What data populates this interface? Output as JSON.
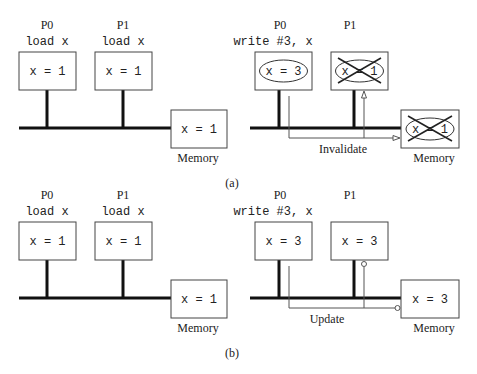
{
  "panels": {
    "a": {
      "label": "(a)",
      "before": {
        "p0": {
          "name": "P0",
          "op": "load x",
          "cache": "x = 1"
        },
        "p1": {
          "name": "P1",
          "op": "load x",
          "cache": "x = 1"
        },
        "memory": {
          "label": "Memory",
          "value": "x = 1"
        }
      },
      "after": {
        "p0": {
          "name": "P0",
          "op": "write #3, x",
          "cache": "x = 3"
        },
        "p1": {
          "name": "P1",
          "op": "",
          "cache": "x = 1",
          "invalidated": true
        },
        "memory": {
          "label": "Memory",
          "value": "x = 1",
          "invalidated": true
        },
        "signal": "Invalidate"
      }
    },
    "b": {
      "label": "(b)",
      "before": {
        "p0": {
          "name": "P0",
          "op": "load x",
          "cache": "x = 1"
        },
        "p1": {
          "name": "P1",
          "op": "load x",
          "cache": "x = 1"
        },
        "memory": {
          "label": "Memory",
          "value": "x = 1"
        }
      },
      "after": {
        "p0": {
          "name": "P0",
          "op": "write #3, x",
          "cache": "x = 3"
        },
        "p1": {
          "name": "P1",
          "op": "",
          "cache": "x = 3"
        },
        "memory": {
          "label": "Memory",
          "value": "x = 3"
        },
        "signal": "Update"
      }
    }
  }
}
